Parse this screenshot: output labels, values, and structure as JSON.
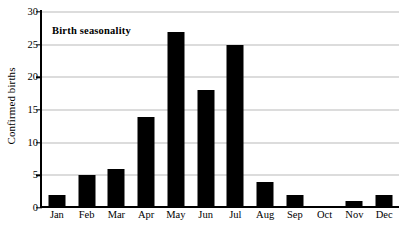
{
  "chart_data": {
    "type": "bar",
    "title": "Birth seasonality",
    "xlabel": "",
    "ylabel": "Confirmed births",
    "categories": [
      "Jan",
      "Feb",
      "Mar",
      "Apr",
      "May",
      "Jun",
      "Jul",
      "Aug",
      "Sep",
      "Oct",
      "Nov",
      "Dec"
    ],
    "values": [
      2,
      5,
      6,
      14,
      27,
      18,
      25,
      4,
      2,
      0,
      1,
      2
    ],
    "ylim": [
      0,
      30
    ],
    "yticks": [
      0,
      5,
      10,
      15,
      20,
      25,
      30
    ],
    "ytick_labels": [
      "0",
      "5",
      "10",
      "15",
      "20",
      "25",
      "30"
    ],
    "grid": true,
    "grid_axis": "y",
    "legend": false,
    "bar_color": "#000000",
    "grid_color": "#b9b9b9",
    "axis_color": "#000000",
    "series": [
      {
        "name": "Confirmed births",
        "values": [
          2,
          5,
          6,
          14,
          27,
          18,
          25,
          4,
          2,
          0,
          1,
          2
        ]
      }
    ]
  }
}
